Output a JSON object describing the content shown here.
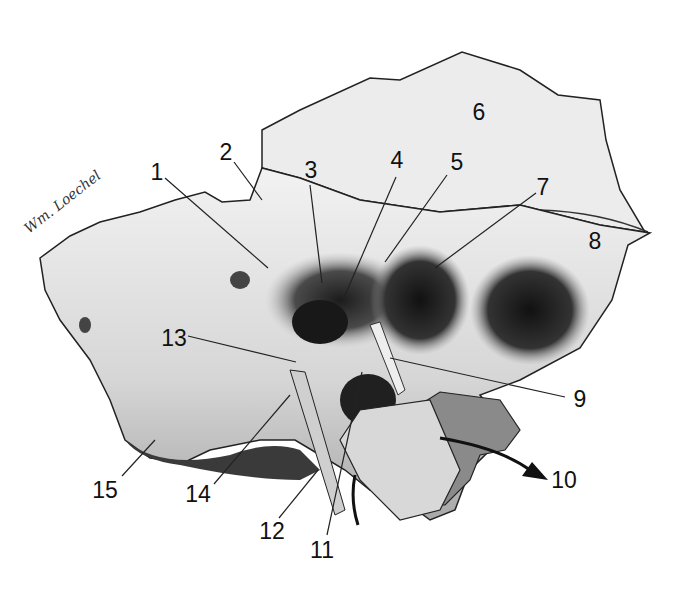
{
  "figure": {
    "signature": "Wm. Loechel",
    "colors": {
      "background": "#ffffff",
      "bone_light": "#e8e8e8",
      "bone_mid": "#bdbdbd",
      "bone_dark": "#2a2a2a",
      "outline": "#222222",
      "label": "#111111"
    },
    "labels": [
      {
        "id": "1",
        "text": "1",
        "x": 157,
        "y": 172,
        "tx": 268,
        "ty": 268
      },
      {
        "id": "2",
        "text": "2",
        "x": 226,
        "y": 152,
        "tx": 262,
        "ty": 200
      },
      {
        "id": "3",
        "text": "3",
        "x": 311,
        "y": 170,
        "tx": 322,
        "ty": 283
      },
      {
        "id": "4",
        "text": "4",
        "x": 397,
        "y": 160,
        "tx": 343,
        "ty": 300
      },
      {
        "id": "5",
        "text": "5",
        "x": 457,
        "y": 162,
        "tx": 385,
        "ty": 262
      },
      {
        "id": "6",
        "text": "6",
        "x": 479,
        "y": 112
      },
      {
        "id": "7",
        "text": "7",
        "x": 543,
        "y": 187,
        "tx": 435,
        "ty": 268
      },
      {
        "id": "8",
        "text": "8",
        "x": 595,
        "y": 241
      },
      {
        "id": "9",
        "text": "9",
        "x": 580,
        "y": 399,
        "tx": 390,
        "ty": 358
      },
      {
        "id": "10",
        "text": "10",
        "x": 564,
        "y": 480
      },
      {
        "id": "11",
        "text": "11",
        "x": 322,
        "y": 550,
        "tx": 362,
        "ty": 372
      },
      {
        "id": "12",
        "text": "12",
        "x": 272,
        "y": 531,
        "tx": 318,
        "ty": 470
      },
      {
        "id": "13",
        "text": "13",
        "x": 174,
        "y": 338,
        "tx": 296,
        "ty": 362
      },
      {
        "id": "14",
        "text": "14",
        "x": 198,
        "y": 494,
        "tx": 290,
        "ty": 395
      },
      {
        "id": "15",
        "text": "15",
        "x": 105,
        "y": 490,
        "tx": 155,
        "ty": 440
      }
    ]
  }
}
